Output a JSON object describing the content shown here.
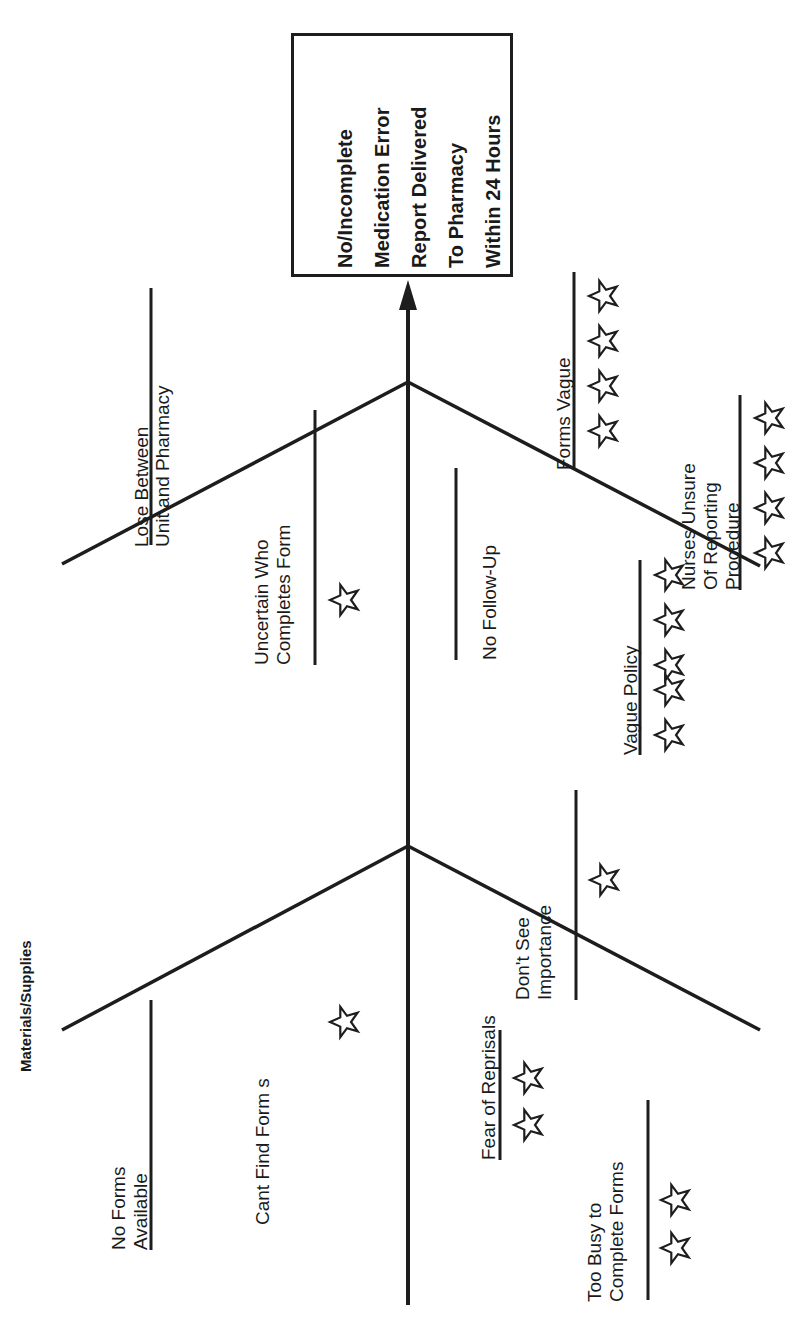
{
  "diagram": {
    "kind": "fishbone",
    "orientation": "rotated-90-ccw",
    "line_color": "#1d1d1d",
    "background": "#ffffff",
    "effect": {
      "name": "effect-box",
      "lines": [
        "No/Incomplete",
        "Medication Error",
        "Report Delivered",
        "To Pharmacy",
        "Within 24 Hours"
      ],
      "text": "No/Incomplete Medication Error Report Delivered To Pharmacy Within 24 Hours"
    },
    "categories": [
      {
        "id": "materials-supplies",
        "label": "Materials/Supplies"
      }
    ],
    "causes": [
      {
        "id": "lose-between-unit-and-pharmacy",
        "lines": [
          "Lose Between",
          "Unit and Pharmacy"
        ],
        "stars": 0
      },
      {
        "id": "uncertain-who-completes-form",
        "lines": [
          "Uncertain Who",
          "Completes Form"
        ],
        "stars": 1
      },
      {
        "id": "no-follow-up",
        "lines": [
          "No Follow-Up"
        ],
        "stars": 0
      },
      {
        "id": "forms-vague",
        "lines": [
          "Forms Vague"
        ],
        "stars": 4
      },
      {
        "id": "nurses-unsure-of-reporting-procedure",
        "lines": [
          "Nurses Unsure",
          "Of Reporting",
          "Procedure"
        ],
        "stars": 4
      },
      {
        "id": "vague-policy",
        "lines": [
          "Vague Policy"
        ],
        "stars": 5
      },
      {
        "id": "no-forms-available",
        "lines": [
          "No Forms",
          "Available"
        ],
        "stars": 0
      },
      {
        "id": "cant-find-forms",
        "lines": [
          "Cant Find Form s"
        ],
        "stars": 1
      },
      {
        "id": "dont-see-importance",
        "lines": [
          "Don't See",
          "Importance"
        ],
        "stars": 1
      },
      {
        "id": "fear-of-reprisals",
        "lines": [
          "Fear of Reprisals"
        ],
        "stars": 2
      },
      {
        "id": "too-busy-to-complete-forms",
        "lines": [
          "Too Busy to",
          "Complete Forms"
        ],
        "stars": 2
      }
    ],
    "text": {
      "effect_l1": "No/Incomplete",
      "effect_l2": "Medication Error",
      "effect_l3": "Report Delivered",
      "effect_l4": "To Pharmacy",
      "effect_l5": "Within 24 Hours",
      "cat_materials": "Materials/Supplies",
      "lose_l1": "Lose Between",
      "lose_l2": "Unit and Pharmacy",
      "uncertain_l1": "Uncertain Who",
      "uncertain_l2": "Completes Form",
      "nofollow_l1": "No Follow-Up",
      "formsvague_l1": "Forms Vague",
      "nurses_l1": "Nurses Unsure",
      "nurses_l2": "Of Reporting",
      "nurses_l3": "Procedure",
      "vaguepolicy_l1": "Vague Policy",
      "noforms_l1": "No Forms",
      "noforms_l2": "Available",
      "cantfind_l1": "Cant Find Form s",
      "dontsee_l1": "Don't See",
      "dontsee_l2": "Importance",
      "fear_l1": "Fear of Reprisals",
      "toobusy_l1": "Too Busy to",
      "toobusy_l2": "Complete Forms"
    }
  }
}
